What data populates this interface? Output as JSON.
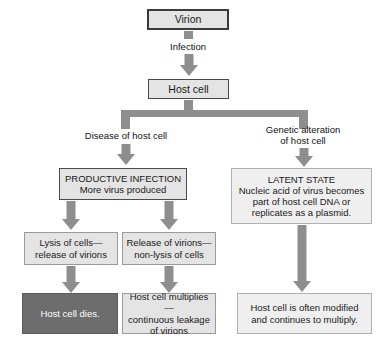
{
  "diagram": {
    "colors": {
      "box_fill": "#e4e4e4",
      "box_fill_light": "#efefef",
      "box_fill_dark": "#6d6d6d",
      "connector": "#8e8e8e",
      "border_dark": "#3b3b3b",
      "border_light": "#9a9a9a",
      "text": "#1a1a1a",
      "text_inverse": "#ffffff"
    },
    "nodes": {
      "virion": "Virion",
      "host_cell": "Host cell",
      "productive_infection": "PRODUCTIVE INFECTION\nMore virus produced",
      "latent_state": "LATENT STATE\nNucleic acid of virus becomes\npart of host cell DNA or\nreplicates as a plasmid.",
      "lysis_of_cells": "Lysis of cells—\nrelease of virions",
      "release_of_virions": "Release of virions—\nnon-lysis of cells",
      "host_cell_dies": "Host cell dies.",
      "host_cell_multiplies": "Host cell multiplies—\ncontinuous leakage\nof virions",
      "host_cell_modified": "Host cell is often modified\nand continues to multiply."
    },
    "edge_labels": {
      "infection": "Infection",
      "disease_of_host_cell": "Disease of host cell",
      "genetic_alteration": "Genetic alteration\nof host cell"
    }
  }
}
